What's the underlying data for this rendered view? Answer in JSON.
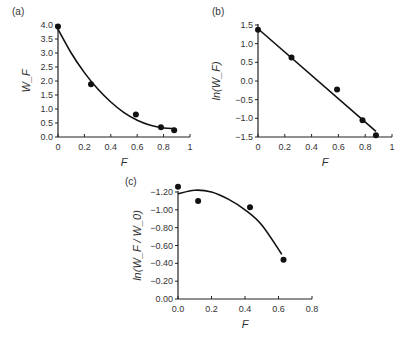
{
  "chart_data": [
    {
      "id": "a",
      "panel_label": "(a)",
      "type": "scatter",
      "xlabel": "F",
      "ylabel": "W_F",
      "xlim": [
        0,
        1
      ],
      "ylim": [
        0,
        4.0
      ],
      "xticks": [
        "0",
        "0.2",
        "0.4",
        "0.6",
        "0.8",
        "1"
      ],
      "yticks": [
        "0.0",
        "0.5",
        "1.0",
        "1.5",
        "2.0",
        "2.5",
        "3.0",
        "3.5",
        "4.0"
      ],
      "points": [
        [
          0.0,
          3.95
        ],
        [
          0.25,
          1.88
        ],
        [
          0.59,
          0.8
        ],
        [
          0.78,
          0.35
        ],
        [
          0.88,
          0.24
        ]
      ],
      "fit": {
        "type": "polynomial",
        "description": "smooth decreasing curve",
        "samples": [
          [
            0.0,
            3.85
          ],
          [
            0.1,
            3.0
          ],
          [
            0.2,
            2.3
          ],
          [
            0.3,
            1.72
          ],
          [
            0.4,
            1.25
          ],
          [
            0.5,
            0.87
          ],
          [
            0.6,
            0.6
          ],
          [
            0.7,
            0.42
          ],
          [
            0.8,
            0.32
          ],
          [
            0.88,
            0.3
          ]
        ]
      },
      "grid": false
    },
    {
      "id": "b",
      "panel_label": "(b)",
      "type": "scatter",
      "xlabel": "F",
      "ylabel": "ln(W_F)",
      "xlim": [
        0,
        1
      ],
      "ylim": [
        -1.5,
        1.5
      ],
      "xticks": [
        "0",
        "0.2",
        "0.4",
        "0.6",
        "0.8",
        "1"
      ],
      "yticks": [
        "-1.5",
        "-1.0",
        "-0.5",
        "0.0",
        "0.5",
        "1.0",
        "1.5"
      ],
      "points": [
        [
          0.0,
          1.37
        ],
        [
          0.25,
          0.63
        ],
        [
          0.59,
          -0.23
        ],
        [
          0.78,
          -1.05
        ],
        [
          0.88,
          -1.45
        ]
      ],
      "fit": {
        "type": "linear",
        "samples": [
          [
            0.0,
            1.4
          ],
          [
            0.88,
            -1.35
          ]
        ]
      },
      "grid": false
    },
    {
      "id": "c",
      "panel_label": "(c)",
      "type": "scatter",
      "xlabel": "F",
      "ylabel": "ln(W_F / W_0)",
      "xlim": [
        0,
        0.8
      ],
      "ylim": [
        -1.2,
        0.0
      ],
      "xticks": [
        "0.0",
        "0.2",
        "0.4",
        "0.6",
        "0.8"
      ],
      "yticks": [
        "0.00",
        "-0.20",
        "-0.40",
        "-0.60",
        "-0.80",
        "-1.00",
        "-1.20"
      ],
      "points": [
        [
          0.0,
          0.06
        ],
        [
          0.12,
          -0.1
        ],
        [
          0.43,
          -0.17
        ],
        [
          0.63,
          -0.76
        ]
      ],
      "fit": {
        "type": "quadratic",
        "samples": [
          [
            0.0,
            -0.02
          ],
          [
            0.1,
            0.02
          ],
          [
            0.2,
            0.0
          ],
          [
            0.3,
            -0.08
          ],
          [
            0.4,
            -0.2
          ],
          [
            0.5,
            -0.37
          ],
          [
            0.62,
            -0.7
          ]
        ]
      },
      "grid": false
    }
  ]
}
